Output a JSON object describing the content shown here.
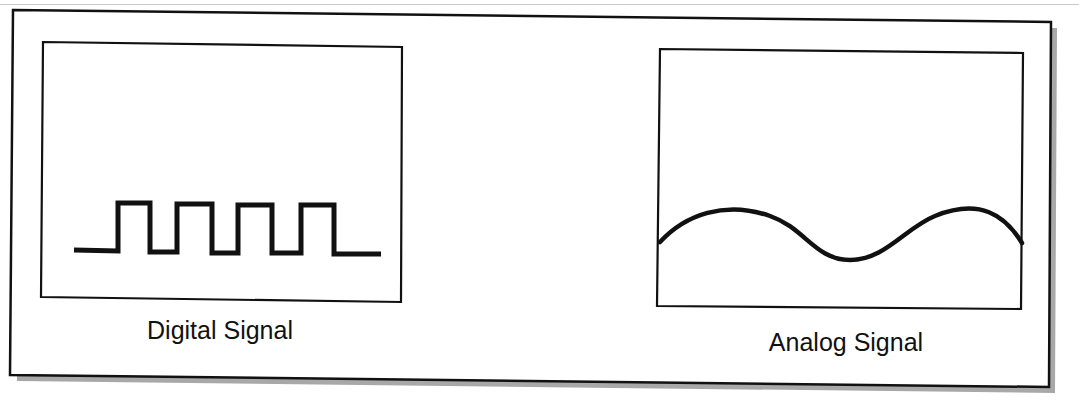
{
  "figure": {
    "panels": [
      {
        "id": "digital",
        "label": "Digital Signal",
        "waveform": "square-wave-icon"
      },
      {
        "id": "analog",
        "label": "Analog Signal",
        "waveform": "sine-wave-icon"
      }
    ],
    "colors": {
      "stroke": "#111111",
      "shadow": "#a8a8a8",
      "background": "#ffffff"
    }
  }
}
